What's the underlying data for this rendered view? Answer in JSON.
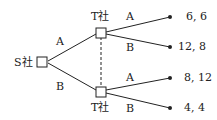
{
  "root": {
    "label": "S社"
  },
  "nodes": [
    {
      "label": "T社"
    },
    {
      "label": "T社"
    }
  ],
  "branches": {
    "root": [
      "A",
      "B"
    ],
    "top": [
      "A",
      "B"
    ],
    "bottom": [
      "A",
      "B"
    ]
  },
  "payoffs": [
    "6, 6",
    "12, 8",
    "8, 12",
    "4, 4"
  ]
}
